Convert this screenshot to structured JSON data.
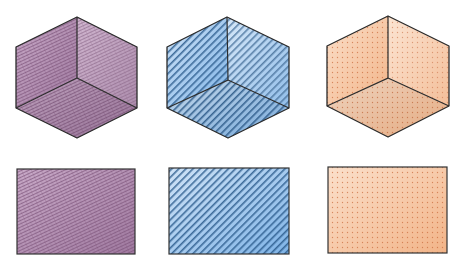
{
  "diagram": {
    "title": "",
    "items": [
      {
        "id": "purple",
        "texture": "crosshatch-scribble",
        "color": "#a07aa0",
        "light": "#c9aac8",
        "dark": "#7d5379",
        "cube": {
          "top": [
            77,
            17
          ],
          "lt": [
            16,
            47
          ],
          "lb": [
            16,
            108
          ],
          "bottom": [
            77,
            138
          ],
          "rb": [
            137,
            108
          ],
          "rt": [
            137,
            47
          ],
          "center": [
            77,
            78
          ]
        },
        "rect": {
          "x": 17,
          "y": 169,
          "w": 118,
          "h": 85
        }
      },
      {
        "id": "blue",
        "texture": "diagonal-stripes",
        "color": "#7fb3e6",
        "light": "#cfe3f7",
        "dark": "#2a5a8c",
        "cube": {
          "top": [
            227,
            17
          ],
          "lt": [
            167,
            47
          ],
          "lb": [
            167,
            108
          ],
          "bottom": [
            228,
            138
          ],
          "rb": [
            289,
            108
          ],
          "rt": [
            289,
            47
          ],
          "center": [
            228,
            80
          ]
        },
        "rect": {
          "x": 169,
          "y": 168,
          "w": 120,
          "h": 86
        }
      },
      {
        "id": "orange",
        "texture": "dot-grid",
        "color": "#f2b488",
        "light": "#fbe0cb",
        "dark": "#c96a3a",
        "cube": {
          "top": [
            388,
            16
          ],
          "lt": [
            327,
            46
          ],
          "lb": [
            327,
            106
          ],
          "bottom": [
            388,
            137
          ],
          "rb": [
            449,
            106
          ],
          "rt": [
            449,
            46
          ],
          "center": [
            388,
            78
          ]
        },
        "rect": {
          "x": 328,
          "y": 167,
          "w": 119,
          "h": 86
        }
      }
    ]
  }
}
